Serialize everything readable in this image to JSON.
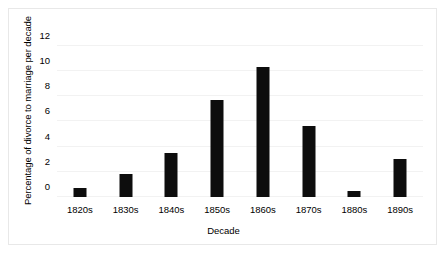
{
  "chart_data": {
    "type": "bar",
    "title": "",
    "xlabel": "Decade",
    "ylabel": "Percentage of divorce to marriage per decade",
    "categories": [
      "1820s",
      "1830s",
      "1840s",
      "1850s",
      "1860s",
      "1870s",
      "1880s",
      "1890s"
    ],
    "values": [
      0.7,
      1.8,
      3.5,
      7.7,
      10.3,
      5.6,
      0.5,
      3.0
    ],
    "yticks": [
      0,
      2,
      4,
      6,
      8,
      10,
      12
    ],
    "ylim": [
      0,
      13
    ],
    "grid": true,
    "legend": false,
    "bar_color": "#0d0d0d",
    "grid_color": "#f2f2f2",
    "border_color": "#e8e8e8"
  }
}
